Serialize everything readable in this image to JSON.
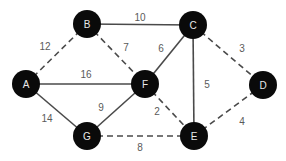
{
  "graph": {
    "colors": {
      "node_fill": "#0a0a0a",
      "node_text": "#e8e8e8",
      "edge": "#4a4a4a",
      "edge_label": "#5a5a5a",
      "background": "#ffffff"
    },
    "node_radius": 14,
    "nodes": [
      {
        "id": "A",
        "label": "A",
        "x": 26,
        "y": 84
      },
      {
        "id": "B",
        "label": "B",
        "x": 87,
        "y": 24
      },
      {
        "id": "C",
        "label": "C",
        "x": 193,
        "y": 25
      },
      {
        "id": "D",
        "label": "D",
        "x": 263,
        "y": 85
      },
      {
        "id": "E",
        "label": "E",
        "x": 194,
        "y": 136
      },
      {
        "id": "F",
        "label": "F",
        "x": 145,
        "y": 84
      },
      {
        "id": "G",
        "label": "G",
        "x": 87,
        "y": 136
      }
    ],
    "edges": [
      {
        "from": "A",
        "to": "B",
        "weight": "12",
        "style": "dashed",
        "lx": 45,
        "ly": 46
      },
      {
        "from": "B",
        "to": "C",
        "weight": "10",
        "style": "solid",
        "lx": 140,
        "ly": 17
      },
      {
        "from": "B",
        "to": "F",
        "weight": "7",
        "style": "dashed",
        "lx": 126,
        "ly": 47
      },
      {
        "from": "A",
        "to": "F",
        "weight": "16",
        "style": "solid",
        "lx": 86,
        "ly": 74
      },
      {
        "from": "A",
        "to": "G",
        "weight": "14",
        "style": "solid",
        "lx": 47,
        "ly": 118
      },
      {
        "from": "C",
        "to": "F",
        "weight": "6",
        "style": "solid",
        "lx": 161,
        "ly": 48
      },
      {
        "from": "C",
        "to": "D",
        "weight": "3",
        "style": "dashed",
        "lx": 242,
        "ly": 48
      },
      {
        "from": "C",
        "to": "E",
        "weight": "5",
        "style": "solid",
        "lx": 207,
        "ly": 84
      },
      {
        "from": "F",
        "to": "G",
        "weight": "9",
        "style": "solid",
        "lx": 101,
        "ly": 107
      },
      {
        "from": "F",
        "to": "E",
        "weight": "2",
        "style": "dashed",
        "lx": 157,
        "ly": 111
      },
      {
        "from": "G",
        "to": "E",
        "weight": "8",
        "style": "dashed",
        "lx": 140,
        "ly": 147
      },
      {
        "from": "D",
        "to": "E",
        "weight": "4",
        "style": "dashed",
        "lx": 242,
        "ly": 121
      }
    ]
  }
}
